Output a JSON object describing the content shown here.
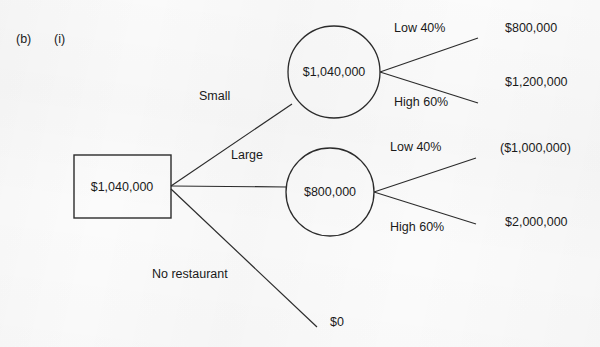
{
  "question": {
    "part": "(b)",
    "subpart": "(i)"
  },
  "diagram": {
    "type": "decision-tree",
    "decision_node": {
      "shape": "square",
      "value": "$1,040,000"
    },
    "branches": [
      {
        "label": "Small",
        "chance_node": {
          "shape": "circle",
          "value": "$1,040,000"
        },
        "outcomes": [
          {
            "prob_label": "Low 40%",
            "payoff": "$800,000"
          },
          {
            "prob_label": "High 60%",
            "payoff": "$1,200,000"
          }
        ]
      },
      {
        "label": "Large",
        "chance_node": {
          "shape": "circle",
          "value": "$800,000"
        },
        "outcomes": [
          {
            "prob_label": "Low 40%",
            "payoff": "($1,000,000)"
          },
          {
            "prob_label": "High 60%",
            "payoff": "$2,000,000"
          }
        ]
      },
      {
        "label": "No restaurant",
        "chance_node": null,
        "outcomes": [
          {
            "prob_label": "",
            "payoff": "$0"
          }
        ]
      }
    ]
  },
  "style": {
    "line_color": "#2b2b2b",
    "text_color": "#1a1a1a",
    "background": "#fbfbfb"
  }
}
